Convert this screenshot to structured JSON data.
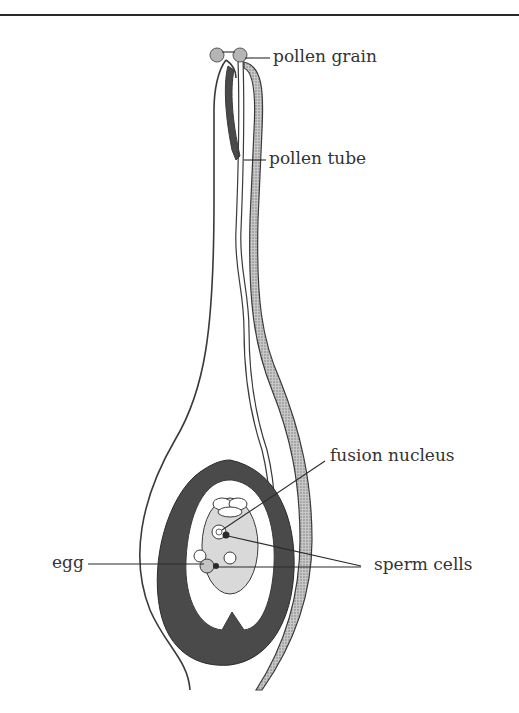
{
  "figure": {
    "labels": {
      "pollen_grain": "pollen grain",
      "pollen_tube": "pollen tube",
      "fusion_nucleus": "fusion nucleus",
      "egg": "egg",
      "sperm_cells": "sperm cells"
    },
    "colors": {
      "outline": "#3a3a3a",
      "dark_tissue": "#4a4a4a",
      "stipple": "#bdbdbd",
      "embryo_sac": "#d9d9d9",
      "text": "#333333"
    }
  }
}
